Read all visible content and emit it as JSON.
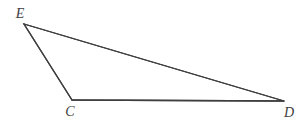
{
  "figure": {
    "kind": "triangle-diagram",
    "width": 301,
    "height": 122,
    "background_color": "#ffffff",
    "stroke_color": "#3e3e3e",
    "stroke_width": 1.3,
    "label_color": "#3e3e3e",
    "label_font_size": 14,
    "label_style": "italic",
    "vertices": [
      {
        "id": "E",
        "label": "E",
        "x": 24,
        "y": 24,
        "label_x": 20,
        "label_y": 14
      },
      {
        "id": "C",
        "label": "C",
        "x": 72,
        "y": 100,
        "label_x": 70,
        "label_y": 112
      },
      {
        "id": "D",
        "label": "D",
        "x": 284,
        "y": 101,
        "label_x": 289,
        "label_y": 113
      }
    ],
    "edges": [
      {
        "id": "ED",
        "from": "E",
        "to": "D"
      },
      {
        "id": "EC",
        "from": "E",
        "to": "C"
      },
      {
        "id": "CD",
        "from": "C",
        "to": "D"
      }
    ],
    "polygon_points": "24,24 284,101 72,100"
  }
}
